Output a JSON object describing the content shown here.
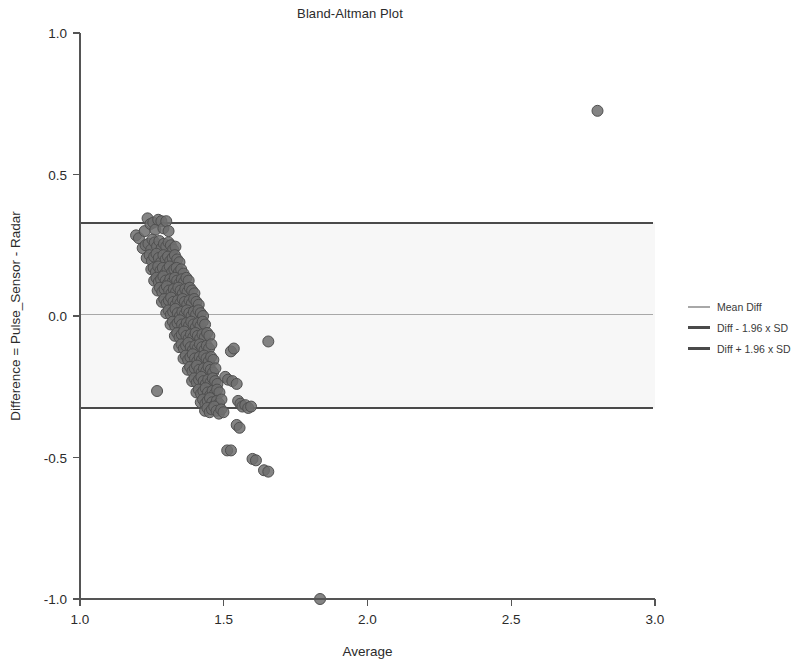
{
  "chart_data": {
    "type": "scatter",
    "title": "Bland-Altman Plot",
    "xlabel": "Average",
    "ylabel": "Difference = Pulse_Sensor - Radar",
    "xlim": [
      1.0,
      3.0
    ],
    "ylim": [
      -1.0,
      1.0
    ],
    "xticks": [
      "1.0",
      "1.5",
      "2.0",
      "2.5",
      "3.0"
    ],
    "xtick_values": [
      1.0,
      1.5,
      2.0,
      2.5,
      3.0
    ],
    "yticks": [
      "1.0",
      "0.5",
      "0.0",
      "-0.5",
      "-1.0"
    ],
    "ytick_values": [
      1.0,
      0.5,
      0.0,
      -0.5,
      -1.0
    ],
    "grid": false,
    "legend_position": "right",
    "reference_lines": [
      {
        "name": "Mean Diff",
        "value": 0.005,
        "color": "#a8a8a8",
        "width": 1.6
      },
      {
        "name": "Diff - 1.96 x SD",
        "value": -0.325,
        "color": "#4a4a4a",
        "width": 2.0
      },
      {
        "name": "Diff + 1.96 x SD",
        "value": 0.33,
        "color": "#4a4a4a",
        "width": 2.0
      }
    ],
    "band": {
      "from": -0.325,
      "to": 0.33,
      "color": "#f7f7f7"
    },
    "marker": {
      "shape": "circle",
      "fill": "#6e6e6e",
      "edge": "#4f4f4f",
      "size": 11,
      "opacity": 0.85
    },
    "points": [
      [
        1.195,
        0.285
      ],
      [
        1.205,
        0.275
      ],
      [
        1.225,
        0.3
      ],
      [
        1.235,
        0.345
      ],
      [
        1.245,
        0.325
      ],
      [
        1.255,
        0.33
      ],
      [
        1.262,
        0.305
      ],
      [
        1.272,
        0.34
      ],
      [
        1.283,
        0.335
      ],
      [
        1.29,
        0.31
      ],
      [
        1.3,
        0.335
      ],
      [
        1.308,
        0.3
      ],
      [
        1.218,
        0.24
      ],
      [
        1.228,
        0.25
      ],
      [
        1.238,
        0.255
      ],
      [
        1.248,
        0.235
      ],
      [
        1.252,
        0.27
      ],
      [
        1.26,
        0.26
      ],
      [
        1.268,
        0.245
      ],
      [
        1.276,
        0.265
      ],
      [
        1.284,
        0.24
      ],
      [
        1.292,
        0.255
      ],
      [
        1.3,
        0.245
      ],
      [
        1.308,
        0.26
      ],
      [
        1.316,
        0.25
      ],
      [
        1.324,
        0.235
      ],
      [
        1.332,
        0.245
      ],
      [
        1.232,
        0.205
      ],
      [
        1.242,
        0.215
      ],
      [
        1.25,
        0.195
      ],
      [
        1.258,
        0.21
      ],
      [
        1.266,
        0.22
      ],
      [
        1.274,
        0.205
      ],
      [
        1.282,
        0.19
      ],
      [
        1.29,
        0.215
      ],
      [
        1.298,
        0.2
      ],
      [
        1.306,
        0.21
      ],
      [
        1.314,
        0.195
      ],
      [
        1.322,
        0.205
      ],
      [
        1.33,
        0.215
      ],
      [
        1.338,
        0.2
      ],
      [
        1.346,
        0.19
      ],
      [
        1.248,
        0.165
      ],
      [
        1.256,
        0.17
      ],
      [
        1.264,
        0.155
      ],
      [
        1.272,
        0.175
      ],
      [
        1.28,
        0.16
      ],
      [
        1.288,
        0.17
      ],
      [
        1.296,
        0.15
      ],
      [
        1.304,
        0.165
      ],
      [
        1.312,
        0.175
      ],
      [
        1.32,
        0.155
      ],
      [
        1.328,
        0.165
      ],
      [
        1.336,
        0.17
      ],
      [
        1.344,
        0.155
      ],
      [
        1.352,
        0.165
      ],
      [
        1.36,
        0.15
      ],
      [
        1.258,
        0.125
      ],
      [
        1.266,
        0.135
      ],
      [
        1.274,
        0.12
      ],
      [
        1.282,
        0.13
      ],
      [
        1.29,
        0.14
      ],
      [
        1.298,
        0.125
      ],
      [
        1.306,
        0.115
      ],
      [
        1.314,
        0.13
      ],
      [
        1.322,
        0.12
      ],
      [
        1.33,
        0.135
      ],
      [
        1.338,
        0.125
      ],
      [
        1.346,
        0.115
      ],
      [
        1.354,
        0.13
      ],
      [
        1.362,
        0.12
      ],
      [
        1.37,
        0.135
      ],
      [
        1.378,
        0.125
      ],
      [
        1.27,
        0.09
      ],
      [
        1.278,
        0.1
      ],
      [
        1.286,
        0.085
      ],
      [
        1.294,
        0.095
      ],
      [
        1.302,
        0.105
      ],
      [
        1.31,
        0.09
      ],
      [
        1.318,
        0.08
      ],
      [
        1.326,
        0.095
      ],
      [
        1.334,
        0.085
      ],
      [
        1.342,
        0.1
      ],
      [
        1.35,
        0.09
      ],
      [
        1.358,
        0.08
      ],
      [
        1.366,
        0.095
      ],
      [
        1.374,
        0.085
      ],
      [
        1.382,
        0.1
      ],
      [
        1.39,
        0.09
      ],
      [
        1.398,
        0.08
      ],
      [
        1.285,
        0.05
      ],
      [
        1.293,
        0.06
      ],
      [
        1.301,
        0.045
      ],
      [
        1.309,
        0.055
      ],
      [
        1.317,
        0.065
      ],
      [
        1.325,
        0.05
      ],
      [
        1.333,
        0.04
      ],
      [
        1.341,
        0.055
      ],
      [
        1.349,
        0.045
      ],
      [
        1.357,
        0.06
      ],
      [
        1.365,
        0.05
      ],
      [
        1.373,
        0.04
      ],
      [
        1.381,
        0.055
      ],
      [
        1.389,
        0.045
      ],
      [
        1.397,
        0.06
      ],
      [
        1.405,
        0.05
      ],
      [
        1.413,
        0.04
      ],
      [
        1.3,
        0.01
      ],
      [
        1.308,
        0.02
      ],
      [
        1.316,
        0.005
      ],
      [
        1.324,
        0.015
      ],
      [
        1.332,
        0.025
      ],
      [
        1.34,
        0.01
      ],
      [
        1.348,
        0.0
      ],
      [
        1.356,
        0.015
      ],
      [
        1.364,
        0.005
      ],
      [
        1.372,
        0.02
      ],
      [
        1.38,
        0.01
      ],
      [
        1.388,
        0.0
      ],
      [
        1.396,
        0.015
      ],
      [
        1.404,
        0.005
      ],
      [
        1.412,
        0.02
      ],
      [
        1.42,
        0.01
      ],
      [
        1.428,
        0.0
      ],
      [
        1.315,
        -0.03
      ],
      [
        1.323,
        -0.02
      ],
      [
        1.331,
        -0.035
      ],
      [
        1.339,
        -0.025
      ],
      [
        1.347,
        -0.015
      ],
      [
        1.355,
        -0.03
      ],
      [
        1.363,
        -0.04
      ],
      [
        1.371,
        -0.025
      ],
      [
        1.379,
        -0.035
      ],
      [
        1.387,
        -0.02
      ],
      [
        1.395,
        -0.03
      ],
      [
        1.403,
        -0.04
      ],
      [
        1.411,
        -0.025
      ],
      [
        1.419,
        -0.035
      ],
      [
        1.427,
        -0.02
      ],
      [
        1.435,
        -0.03
      ],
      [
        1.33,
        -0.07
      ],
      [
        1.338,
        -0.06
      ],
      [
        1.346,
        -0.075
      ],
      [
        1.354,
        -0.065
      ],
      [
        1.362,
        -0.055
      ],
      [
        1.37,
        -0.07
      ],
      [
        1.378,
        -0.08
      ],
      [
        1.386,
        -0.065
      ],
      [
        1.394,
        -0.075
      ],
      [
        1.402,
        -0.06
      ],
      [
        1.41,
        -0.07
      ],
      [
        1.418,
        -0.08
      ],
      [
        1.426,
        -0.065
      ],
      [
        1.434,
        -0.075
      ],
      [
        1.442,
        -0.06
      ],
      [
        1.45,
        -0.07
      ],
      [
        1.345,
        -0.11
      ],
      [
        1.353,
        -0.1
      ],
      [
        1.361,
        -0.115
      ],
      [
        1.369,
        -0.105
      ],
      [
        1.377,
        -0.095
      ],
      [
        1.385,
        -0.11
      ],
      [
        1.393,
        -0.12
      ],
      [
        1.401,
        -0.105
      ],
      [
        1.409,
        -0.115
      ],
      [
        1.417,
        -0.1
      ],
      [
        1.425,
        -0.11
      ],
      [
        1.433,
        -0.12
      ],
      [
        1.441,
        -0.105
      ],
      [
        1.449,
        -0.115
      ],
      [
        1.457,
        -0.1
      ],
      [
        1.36,
        -0.15
      ],
      [
        1.368,
        -0.14
      ],
      [
        1.376,
        -0.155
      ],
      [
        1.384,
        -0.145
      ],
      [
        1.392,
        -0.135
      ],
      [
        1.4,
        -0.15
      ],
      [
        1.408,
        -0.16
      ],
      [
        1.416,
        -0.145
      ],
      [
        1.424,
        -0.155
      ],
      [
        1.432,
        -0.14
      ],
      [
        1.44,
        -0.15
      ],
      [
        1.448,
        -0.16
      ],
      [
        1.456,
        -0.145
      ],
      [
        1.464,
        -0.155
      ],
      [
        1.375,
        -0.19
      ],
      [
        1.383,
        -0.18
      ],
      [
        1.391,
        -0.195
      ],
      [
        1.399,
        -0.185
      ],
      [
        1.407,
        -0.175
      ],
      [
        1.415,
        -0.19
      ],
      [
        1.423,
        -0.2
      ],
      [
        1.431,
        -0.185
      ],
      [
        1.439,
        -0.195
      ],
      [
        1.447,
        -0.18
      ],
      [
        1.455,
        -0.19
      ],
      [
        1.463,
        -0.2
      ],
      [
        1.471,
        -0.185
      ],
      [
        1.39,
        -0.23
      ],
      [
        1.398,
        -0.22
      ],
      [
        1.406,
        -0.235
      ],
      [
        1.414,
        -0.225
      ],
      [
        1.422,
        -0.215
      ],
      [
        1.43,
        -0.23
      ],
      [
        1.438,
        -0.24
      ],
      [
        1.446,
        -0.225
      ],
      [
        1.454,
        -0.235
      ],
      [
        1.462,
        -0.22
      ],
      [
        1.47,
        -0.23
      ],
      [
        1.478,
        -0.24
      ],
      [
        1.405,
        -0.27
      ],
      [
        1.413,
        -0.26
      ],
      [
        1.421,
        -0.275
      ],
      [
        1.429,
        -0.265
      ],
      [
        1.437,
        -0.255
      ],
      [
        1.445,
        -0.27
      ],
      [
        1.453,
        -0.28
      ],
      [
        1.461,
        -0.265
      ],
      [
        1.469,
        -0.275
      ],
      [
        1.477,
        -0.26
      ],
      [
        1.485,
        -0.27
      ],
      [
        1.42,
        -0.305
      ],
      [
        1.428,
        -0.295
      ],
      [
        1.436,
        -0.31
      ],
      [
        1.444,
        -0.3
      ],
      [
        1.452,
        -0.29
      ],
      [
        1.46,
        -0.305
      ],
      [
        1.468,
        -0.315
      ],
      [
        1.476,
        -0.3
      ],
      [
        1.484,
        -0.31
      ],
      [
        1.492,
        -0.295
      ],
      [
        1.435,
        -0.335
      ],
      [
        1.443,
        -0.325
      ],
      [
        1.451,
        -0.34
      ],
      [
        1.459,
        -0.33
      ],
      [
        1.467,
        -0.32
      ],
      [
        1.475,
        -0.335
      ],
      [
        1.483,
        -0.345
      ],
      [
        1.491,
        -0.33
      ],
      [
        1.499,
        -0.34
      ],
      [
        1.505,
        -0.215
      ],
      [
        1.515,
        -0.225
      ],
      [
        1.53,
        -0.23
      ],
      [
        1.545,
        -0.24
      ],
      [
        1.55,
        -0.3
      ],
      [
        1.558,
        -0.31
      ],
      [
        1.565,
        -0.32
      ],
      [
        1.575,
        -0.315
      ],
      [
        1.585,
        -0.325
      ],
      [
        1.595,
        -0.32
      ],
      [
        1.268,
        -0.265
      ],
      [
        1.525,
        -0.125
      ],
      [
        1.535,
        -0.115
      ],
      [
        1.545,
        -0.385
      ],
      [
        1.555,
        -0.395
      ],
      [
        1.512,
        -0.475
      ],
      [
        1.525,
        -0.475
      ],
      [
        1.6,
        -0.505
      ],
      [
        1.612,
        -0.51
      ],
      [
        1.64,
        -0.545
      ],
      [
        1.655,
        -0.55
      ],
      [
        1.655,
        -0.09
      ],
      [
        1.835,
        -1.0
      ],
      [
        2.8,
        0.725
      ]
    ]
  },
  "legend": {
    "items": [
      {
        "label": "Mean Diff",
        "color": "#a8a8a8",
        "thickness": 2
      },
      {
        "label": "Diff - 1.96 x SD",
        "color": "#4a4a4a",
        "thickness": 3
      },
      {
        "label": "Diff + 1.96 x SD",
        "color": "#4a4a4a",
        "thickness": 3
      }
    ]
  },
  "watermark": {
    "line1": "Bland-Altman Plot for Heart Rate",
    "line2": "Measurement"
  }
}
